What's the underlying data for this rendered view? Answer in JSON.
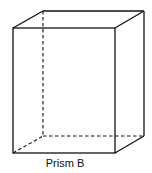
{
  "figure": {
    "label": "Prism B",
    "shape": "rectangular-prism",
    "stroke_color": "#111111",
    "background": "#ffffff",
    "front_face": {
      "x1": 13,
      "y1": 28,
      "x2": 115,
      "y2": 153
    },
    "back_face": {
      "x1": 43,
      "y1": 11,
      "x2": 144,
      "y2": 136
    },
    "hidden_edges": [
      "back-left-vertical",
      "back-bottom",
      "bottom-left-depth"
    ]
  }
}
